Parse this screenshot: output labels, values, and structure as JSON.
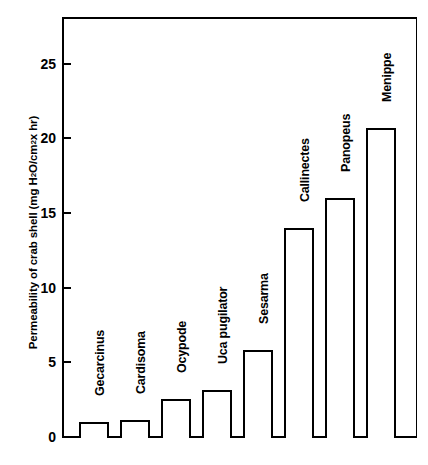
{
  "chart_data": {
    "type": "bar",
    "title": "",
    "xlabel": "",
    "ylabel_parts": {
      "pre": "Permeability of crab shell (mg H",
      "sub1": "2",
      "mid": "O/cm",
      "sup1": "2",
      "post": " x hr)"
    },
    "ylabel": "Permeability of crab shell (mg H2O/cm2 x hr)",
    "categories": [
      "Gecarcinus",
      "Cardisoma",
      "Ocypode",
      "Uca pugilator",
      "Sesarma",
      "Callinectes",
      "Panopeus",
      "Menippe"
    ],
    "values": [
      1.1,
      1.2,
      2.6,
      3.2,
      5.9,
      14.1,
      16.1,
      20.8
    ],
    "ylim": [
      0,
      28
    ],
    "yticks": [
      0,
      5,
      10,
      15,
      20,
      25
    ],
    "ytick_labels": [
      "0",
      "5",
      "10",
      "15",
      "20",
      "25"
    ],
    "grid": false,
    "legend": false,
    "bar_fill_color": "#ffffff",
    "bar_edge_color": "#000000",
    "axis_color": "#000000"
  }
}
